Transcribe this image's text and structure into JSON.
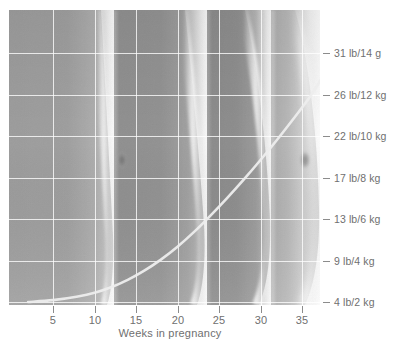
{
  "chart_data": {
    "type": "line",
    "title": "",
    "xlabel": "Weeks in pregnancy",
    "ylabel": "",
    "x_ticks": [
      5,
      10,
      15,
      20,
      25,
      30,
      35
    ],
    "x_tick_labels": [
      "5",
      "10",
      "15",
      "20",
      "25",
      "30",
      "35"
    ],
    "xlim": [
      2,
      39
    ],
    "y_tick_labels": [
      "31 lb/14 g",
      "26 lb/12 kg",
      "22 lb/10 kg",
      "17 lb/8 kg",
      "13 lb/6 kg",
      "9 lb/4 kg",
      "4 lb/2 kg"
    ],
    "y_tick_values_lb": [
      31,
      26,
      22,
      17,
      13,
      9,
      4
    ],
    "y_tick_values_kg": [
      14,
      12,
      10,
      8,
      6,
      4,
      2
    ],
    "ylim": [
      4,
      31
    ],
    "grid": true,
    "legend": "none",
    "series": [
      {
        "name": "Weight gain in pregnancy",
        "x": [
          2,
          5,
          8,
          10,
          12,
          14,
          16,
          18,
          20,
          22,
          24,
          26,
          28,
          30,
          32,
          34,
          36,
          38,
          39
        ],
        "values": [
          4.0,
          4.2,
          4.6,
          5.0,
          5.6,
          6.4,
          7.4,
          8.6,
          10.0,
          11.6,
          13.4,
          15.3,
          17.3,
          19.4,
          21.6,
          23.9,
          26.3,
          29.2,
          30.8
        ]
      }
    ],
    "background_image": "grayscale photomontage of four overlapping pregnant abdomen profiles"
  },
  "axes": {
    "x_title": "Weeks in pregnancy"
  },
  "colors": {
    "grid": "#ffffff",
    "curve": "#e8e8e8",
    "tick_text": "#6f6f6f",
    "tick_mark": "#8c8c8c",
    "background": "#ffffff"
  }
}
